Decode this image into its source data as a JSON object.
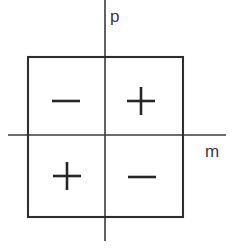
{
  "figure": {
    "type": "diagram",
    "background_color": "#ffffff",
    "line_color": "#2e2e2e",
    "axis_color": "#3b3b3b",
    "width": 239,
    "height": 248
  },
  "axes": {
    "vertical": {
      "name": "p-axis",
      "label": "p",
      "label_x": 110,
      "label_y": 22,
      "x": 105,
      "y_start": 0,
      "y_end": 241
    },
    "horizontal": {
      "name": "m-axis",
      "label": "m",
      "label_x": 205,
      "label_y": 157,
      "y": 135,
      "x_start": 8,
      "x_end": 226
    }
  },
  "box": {
    "name": "bounding-square",
    "x": 28,
    "y": 57,
    "width": 155,
    "height": 160
  },
  "quadrants": [
    {
      "name": "top-left",
      "sign": "−",
      "sign_type": "minus",
      "center_x": 66,
      "center_y": 101
    },
    {
      "name": "top-right",
      "sign": "+",
      "sign_type": "plus",
      "center_x": 141,
      "center_y": 101
    },
    {
      "name": "bottom-left",
      "sign": "+",
      "sign_type": "plus",
      "center_x": 67,
      "center_y": 176
    },
    {
      "name": "bottom-right",
      "sign": "−",
      "sign_type": "minus",
      "center_x": 142,
      "center_y": 177
    }
  ],
  "sign_glyph": {
    "half_width": 14,
    "half_height": 14
  }
}
